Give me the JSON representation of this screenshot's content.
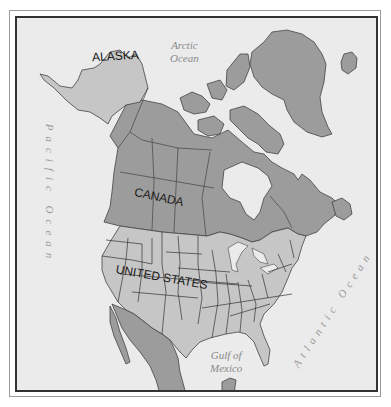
{
  "map": {
    "title": "North America",
    "colors": {
      "ocean": "#ebebeb",
      "us_land": "#c6c6c6",
      "other_land": "#9c9c9c",
      "borders": "#333333",
      "ocean_label": "#8a8a8a",
      "frame": "#333333"
    },
    "country_labels": [
      {
        "id": "alaska",
        "text": "ALASKA"
      },
      {
        "id": "canada",
        "text": "CANADA"
      },
      {
        "id": "united_states",
        "text": "UNITED STATES"
      }
    ],
    "water_labels": {
      "arctic_line1": "Arctic",
      "arctic_line2": "Ocean",
      "pacific": "Pacific Ocean",
      "atlantic": "Atlantic Ocean",
      "gulf_line1": "Gulf of",
      "gulf_line2": "Mexico"
    }
  }
}
